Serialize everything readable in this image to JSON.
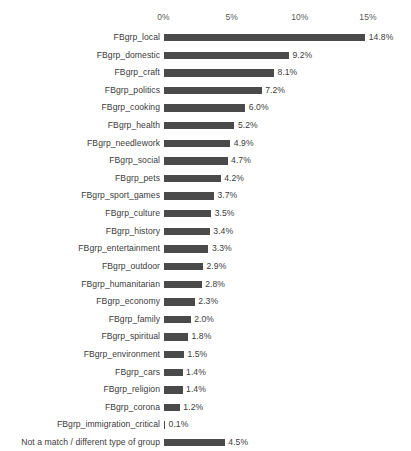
{
  "chart_data": {
    "type": "bar",
    "orientation": "horizontal",
    "title": "",
    "subtitle": "",
    "xlabel": "",
    "ylabel": "",
    "xlim": [
      0,
      16.5
    ],
    "grid": false,
    "legend": null,
    "axis_ticks": [
      "0%",
      "5%",
      "10%",
      "15%"
    ],
    "axis_tick_values": [
      0,
      5,
      10,
      15
    ],
    "bar_color": "#4a4a4a",
    "value_label_suffix": "%",
    "categories": [
      "FBgrp_local",
      "FBgrp_domestic",
      "FBgrp_craft",
      "FBgrp_politics",
      "FBgrp_cooking",
      "FBgrp_health",
      "FBgrp_needlework",
      "FBgrp_social",
      "FBgrp_pets",
      "FBgrp_sport_games",
      "FBgrp_culture",
      "FBgrp_history",
      "FBgrp_entertainment",
      "FBgrp_outdoor",
      "FBgrp_humanitarian",
      "FBgrp_economy",
      "FBgrp_family",
      "FBgrp_spiritual",
      "FBgrp_environment",
      "FBgrp_cars",
      "FBgrp_religion",
      "FBgrp_corona",
      "FBgrp_immigration_critical",
      "Not a match / different type of group"
    ],
    "values": [
      14.8,
      9.2,
      8.1,
      7.2,
      6.0,
      5.2,
      4.9,
      4.7,
      4.2,
      3.7,
      3.5,
      3.4,
      3.3,
      2.9,
      2.8,
      2.3,
      2.0,
      1.8,
      1.5,
      1.4,
      1.4,
      1.2,
      0.1,
      4.5
    ],
    "value_labels": [
      "14.8%",
      "9.2%",
      "8.1%",
      "7.2%",
      "6.0%",
      "5.2%",
      "4.9%",
      "4.7%",
      "4.2%",
      "3.7%",
      "3.5%",
      "3.4%",
      "3.3%",
      "2.9%",
      "2.8%",
      "2.3%",
      "2.0%",
      "1.8%",
      "1.5%",
      "1.4%",
      "1.4%",
      "1.2%",
      "0.1%",
      "4.5%"
    ]
  }
}
